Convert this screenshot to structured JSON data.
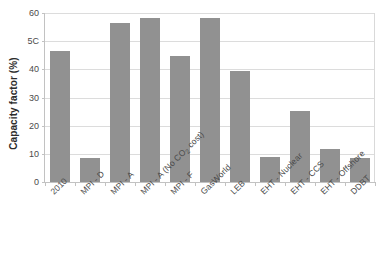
{
  "chart_data": {
    "type": "bar",
    "title": "",
    "xlabel": "",
    "ylabel": "Capacity factor (%)",
    "ylim": [
      0,
      60
    ],
    "ytick_labels": [
      "0",
      "10",
      "20",
      "30",
      "40",
      "5C",
      "60"
    ],
    "ytick_values": [
      0,
      10,
      20,
      30,
      40,
      50,
      60
    ],
    "grid": true,
    "legend": false,
    "bar_color": "#919191",
    "gridline_color": "#dcdcdc",
    "axis_color": "#c2c2c2",
    "categories": [
      "2010",
      "MPI - D",
      "MPI - A",
      "MPI - A (No CO2 cost)",
      "MPI - F",
      "GasWorld",
      "LEB",
      "EHT - Nuclear",
      "EHT - CCS",
      "EHT - Offshore",
      "DDBT"
    ],
    "categories_display": [
      "2010",
      "MPI - D",
      "MPI - A",
      "MPI - A (No CO|2| cost)",
      "MPI - F",
      "GasWorld",
      "LEB",
      "EHT - Nuclear",
      "EHT - CCS",
      "EHT - Offshore",
      "DDBT"
    ],
    "values": [
      46.5,
      8.6,
      56.6,
      58.4,
      44.8,
      58.4,
      39.5,
      8.9,
      25.2,
      11.8,
      8.5
    ]
  }
}
